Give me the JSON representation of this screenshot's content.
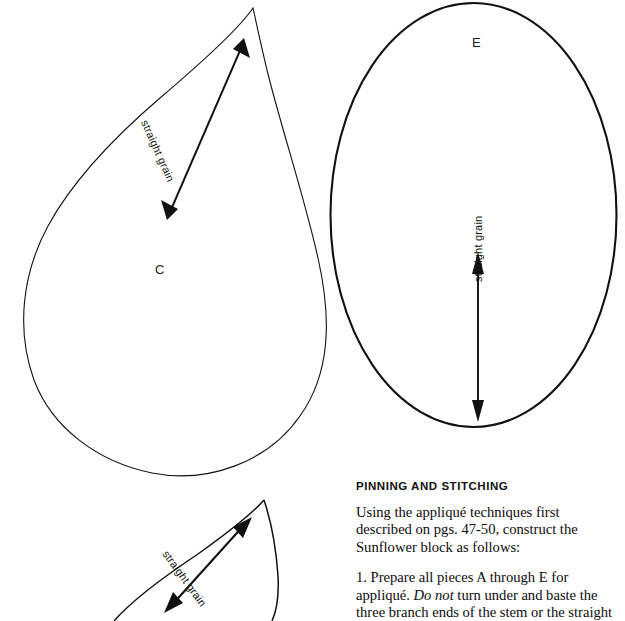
{
  "page": {
    "background_color": "#fefefe",
    "ink_color": "#111111",
    "width": 625,
    "height": 621
  },
  "templates": [
    {
      "id": "piece-c",
      "shape": "teardrop",
      "label": "C",
      "grain_label": "straight grain",
      "grain_direction": "diagonal",
      "label_x": 155,
      "label_y": 262
    },
    {
      "id": "piece-e",
      "shape": "ellipse",
      "label": "E",
      "grain_label": "straight grain",
      "grain_direction": "vertical",
      "label_x": 472,
      "label_y": 35
    },
    {
      "id": "piece-partial",
      "shape": "teardrop-partial",
      "label": "",
      "grain_label": "straight grain",
      "grain_direction": "diagonal",
      "label_x": 0,
      "label_y": 0
    }
  ],
  "instructions": {
    "heading": "PINNING AND STITCHING",
    "paragraphs": [
      {
        "id": "intro",
        "runs": [
          {
            "text": "Using the appliqué techniques first described on pgs. 47-50, construct the Sunflower block as follows:",
            "style": "normal"
          }
        ]
      },
      {
        "id": "step-1",
        "runs": [
          {
            "text": "1. Prepare all pieces A through E for appliqué. ",
            "style": "normal"
          },
          {
            "text": "Do not",
            "style": "italic"
          },
          {
            "text": " turn under and baste the three branch ends of the stem or the straight",
            "style": "normal"
          }
        ]
      }
    ]
  }
}
